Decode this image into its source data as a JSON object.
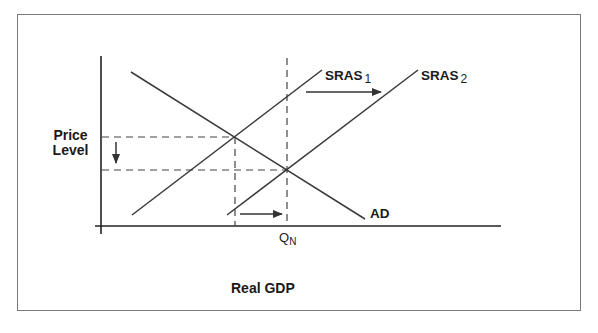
{
  "diagram": {
    "title": "",
    "y_axis_label_line1": "Price",
    "y_axis_label_line2": "Level",
    "x_axis_label": "Real GDP",
    "curves": {
      "sras1": {
        "label": "SRAS",
        "subscript": "1"
      },
      "sras2": {
        "label": "SRAS",
        "subscript": "2"
      },
      "ad": {
        "label": "AD"
      }
    },
    "x_marker": {
      "label": "Q",
      "subscript": "N"
    },
    "arrows": {
      "supply_shift": "right",
      "output_shift": "right",
      "price_change": "down"
    },
    "colors": {
      "line": "#3a3a3a",
      "frame": "#7a7a7a",
      "text": "#1a1a1a"
    }
  }
}
